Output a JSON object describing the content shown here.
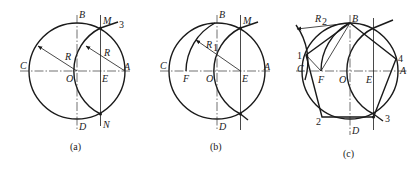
{
  "figure": {
    "panels": [
      {
        "caption": "(a)",
        "labels": {
          "B": "B",
          "M": "M",
          "three": "3",
          "C": "C",
          "R1": "R",
          "R2": "R",
          "O": "O",
          "E": "E",
          "A": "A",
          "D": "D",
          "N": "N"
        }
      },
      {
        "caption": "(b)",
        "labels": {
          "B": "B",
          "M": "M",
          "R": "R",
          "R_sub": "1",
          "C": "C",
          "F": "F",
          "O": "O",
          "E": "E",
          "A": "A",
          "D": "D"
        }
      },
      {
        "caption": "(c)",
        "labels": {
          "R": "R",
          "R_sub": "2",
          "B": "B",
          "one": "1",
          "four": "4",
          "C": "C",
          "F": "F",
          "O": "O",
          "E": "E",
          "A": "A",
          "two": "2",
          "three": "3",
          "D": "D"
        }
      }
    ]
  }
}
